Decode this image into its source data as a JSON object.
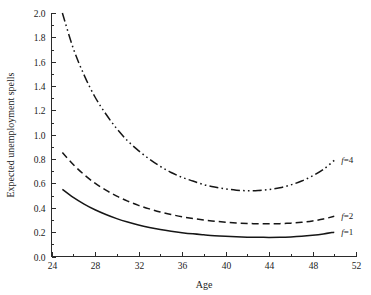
{
  "chart_data": {
    "type": "line",
    "title": "",
    "xlabel": "Age",
    "ylabel": "Expected unemployment spells",
    "xlim": [
      24,
      52
    ],
    "ylim": [
      0.0,
      2.0
    ],
    "grid": false,
    "legend_position": "right-inline",
    "x_ticks_major": [
      24,
      28,
      32,
      36,
      40,
      44,
      48,
      52
    ],
    "x_ticks_minor": [
      26,
      30,
      34,
      38,
      42,
      46,
      50
    ],
    "x_tick_labels": [
      "24",
      "28",
      "32",
      "36",
      "40",
      "44",
      "48",
      "52"
    ],
    "y_ticks_major": [
      0.0,
      0.2,
      0.4,
      0.6,
      0.8,
      1.0,
      1.2,
      1.4,
      1.6,
      1.8,
      2.0
    ],
    "y_tick_labels": [
      "0.0",
      "0.2",
      "0.4",
      "0.6",
      "0.8",
      "1.0",
      "1.2",
      "1.4",
      "1.6",
      "1.8",
      "2.0"
    ],
    "x": [
      25,
      26,
      27,
      28,
      29,
      30,
      31,
      32,
      33,
      34,
      35,
      36,
      37,
      38,
      39,
      40,
      41,
      42,
      43,
      44,
      45,
      46,
      47,
      48,
      49,
      50
    ],
    "series": [
      {
        "name": "f=4",
        "label": "f=4",
        "dash": "dash-dot-dot",
        "values": [
          2.0,
          1.71,
          1.49,
          1.31,
          1.17,
          1.05,
          0.95,
          0.87,
          0.8,
          0.74,
          0.69,
          0.65,
          0.62,
          0.59,
          0.57,
          0.555,
          0.545,
          0.54,
          0.542,
          0.55,
          0.565,
          0.588,
          0.62,
          0.662,
          0.715,
          0.79
        ]
      },
      {
        "name": "f=2",
        "label": "f=2",
        "dash": "dashed",
        "values": [
          0.855,
          0.755,
          0.672,
          0.602,
          0.545,
          0.496,
          0.455,
          0.42,
          0.391,
          0.366,
          0.345,
          0.327,
          0.312,
          0.3,
          0.29,
          0.282,
          0.276,
          0.2715,
          0.269,
          0.2685,
          0.27,
          0.274,
          0.281,
          0.292,
          0.308,
          0.33
        ]
      },
      {
        "name": "f=1",
        "label": "f=1",
        "dash": "solid",
        "values": [
          0.552,
          0.486,
          0.431,
          0.384,
          0.345,
          0.311,
          0.283,
          0.259,
          0.239,
          0.222,
          0.208,
          0.196,
          0.186,
          0.178,
          0.171,
          0.166,
          0.162,
          0.159,
          0.1575,
          0.157,
          0.158,
          0.161,
          0.166,
          0.174,
          0.185,
          0.2
        ]
      }
    ],
    "colors": {
      "curve": "#161616",
      "axis": "#2b2b2b",
      "text": "#1a1a1a",
      "background": "#ffffff"
    }
  }
}
